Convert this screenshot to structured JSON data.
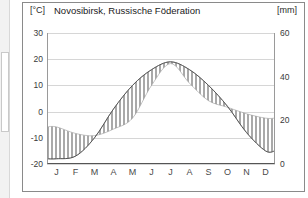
{
  "header": {
    "unit_left": "[°C]",
    "title": "Novosibirsk, Russische Föderation",
    "unit_right": "[mm]"
  },
  "axes": {
    "y_left_ticks": [
      "30",
      "20",
      "10",
      "0",
      "-10",
      "-20"
    ],
    "y_right_ticks": [
      "60",
      "40",
      "20",
      "0"
    ],
    "x_ticks": [
      "J",
      "F",
      "M",
      "A",
      "M",
      "J",
      "J",
      "A",
      "S",
      "O",
      "N",
      "D"
    ]
  },
  "colors": {
    "frame": "#8a8a8a",
    "grid": "#d6d6d6",
    "temp_line": "#555555",
    "precip_bar": "#a9a9a9",
    "background": "#ffffff"
  },
  "chart_data": {
    "type": "line",
    "title": "Novosibirsk, Russische Föderation",
    "xlabel": "",
    "ylabel": "Temperatur [°C]",
    "y2label": "Niederschlag [mm]",
    "grid": true,
    "legend": "none",
    "categories": [
      "J",
      "F",
      "M",
      "A",
      "M",
      "J",
      "J",
      "A",
      "S",
      "O",
      "N",
      "D"
    ],
    "ylim": [
      -20,
      30
    ],
    "y2lim": [
      0,
      60
    ],
    "series": [
      {
        "name": "Temperatur",
        "unit": "°C",
        "type": "line",
        "axis": "left",
        "values": [
          -18,
          -17,
          -10,
          1,
          10,
          16,
          19,
          16,
          10,
          2,
          -8,
          -15
        ]
      },
      {
        "name": "Niederschlag",
        "unit": "mm",
        "type": "bar",
        "axis": "right",
        "values": [
          17,
          14,
          13,
          16,
          21,
          36,
          46,
          37,
          29,
          26,
          23,
          21
        ]
      }
    ]
  }
}
